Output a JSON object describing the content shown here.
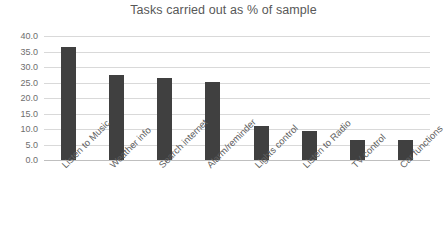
{
  "chart_data": {
    "type": "bar",
    "title": "Tasks carried out as % of sample",
    "xlabel": "",
    "ylabel": "",
    "ylim": [
      0,
      40
    ],
    "ytick_step": 5,
    "ytick_labels": [
      "40.0",
      "35.0",
      "30.0",
      "25.0",
      "20.0",
      "15.0",
      "10.0",
      "5.0",
      "0.0"
    ],
    "grid": true,
    "legend": false,
    "bar_color": "#404040",
    "gridline_color": "#d9d9d9",
    "categories": [
      "Listen to Music",
      "Weather info",
      "Search internet",
      "Alarm/reminder",
      "Lights control",
      "Listen to Radio",
      "TV control",
      "Car functions"
    ],
    "values": [
      36.5,
      27.5,
      26.5,
      25.0,
      11.0,
      9.5,
      6.5,
      6.5
    ]
  }
}
